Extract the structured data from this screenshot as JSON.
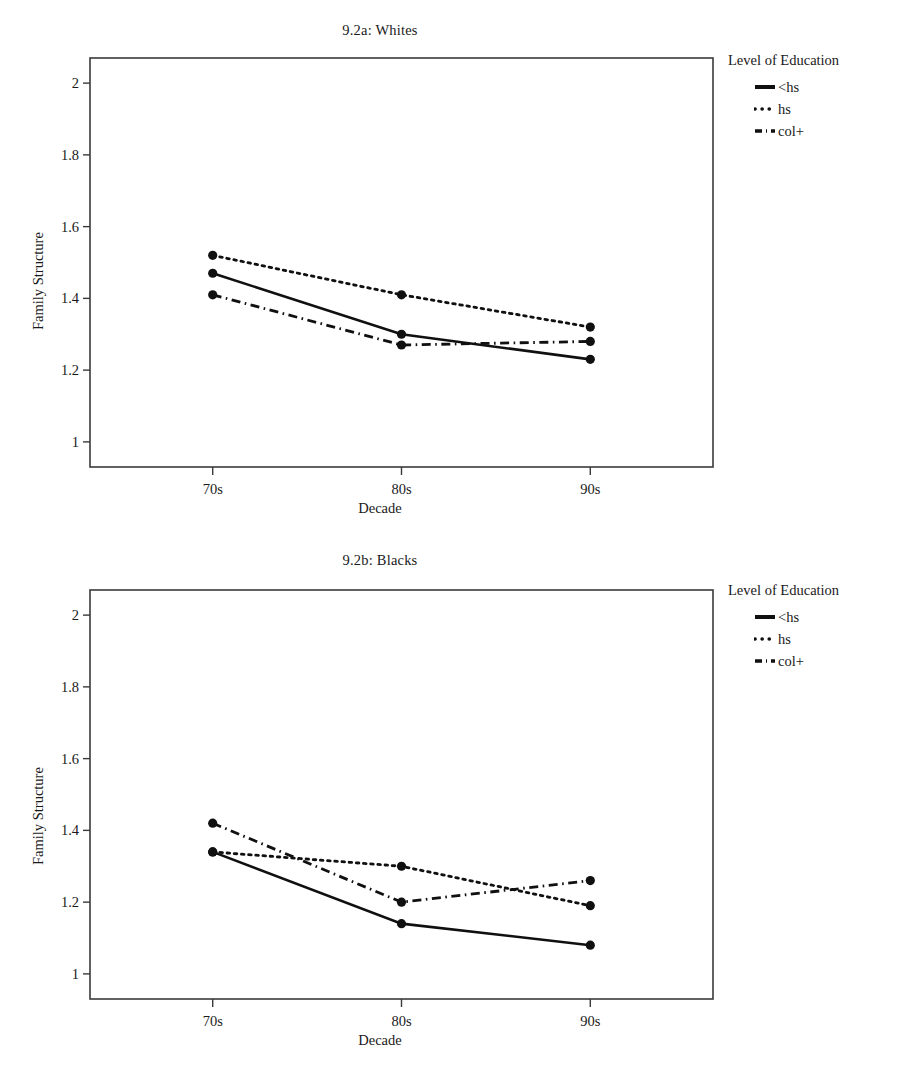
{
  "figures": [
    {
      "id": "a",
      "title": "9.2a: Whites",
      "xlabel": "Decade",
      "ylabel": "Family Structure",
      "legend_title": "Level of Education"
    },
    {
      "id": "b",
      "title": "9.2b: Blacks",
      "xlabel": "Decade",
      "ylabel": "Family Structure",
      "legend_title": "Level of Education"
    }
  ],
  "chart_data": [
    {
      "type": "line",
      "title": "9.2a: Whites",
      "xlabel": "Decade",
      "ylabel": "Family Structure",
      "categories": [
        "70s",
        "80s",
        "90s"
      ],
      "xticklabels": [
        "70s",
        "80s",
        "90s"
      ],
      "yticklabels": [
        "1",
        "1.2",
        "1.4",
        "1.6",
        "1.8",
        "2"
      ],
      "yticks": [
        1,
        1.2,
        1.4,
        1.6,
        1.8,
        2
      ],
      "ylim": [
        0.93,
        2.07
      ],
      "grid": false,
      "legend_title": "Level of Education",
      "legend_position": "right",
      "series": [
        {
          "name": "<hs",
          "style": "solid",
          "values": [
            1.47,
            1.3,
            1.23
          ]
        },
        {
          "name": "hs",
          "style": "dotted",
          "values": [
            1.52,
            1.41,
            1.32
          ]
        },
        {
          "name": "col+",
          "style": "dashdot",
          "values": [
            1.41,
            1.27,
            1.28
          ]
        }
      ]
    },
    {
      "type": "line",
      "title": "9.2b: Blacks",
      "xlabel": "Decade",
      "ylabel": "Family Structure",
      "categories": [
        "70s",
        "80s",
        "90s"
      ],
      "xticklabels": [
        "70s",
        "80s",
        "90s"
      ],
      "yticklabels": [
        "1",
        "1.2",
        "1.4",
        "1.6",
        "1.8",
        "2"
      ],
      "yticks": [
        1,
        1.2,
        1.4,
        1.6,
        1.8,
        2
      ],
      "ylim": [
        0.93,
        2.07
      ],
      "grid": false,
      "legend_title": "Level of Education",
      "legend_position": "right",
      "series": [
        {
          "name": "<hs",
          "style": "solid",
          "values": [
            1.34,
            1.14,
            1.08
          ]
        },
        {
          "name": "hs",
          "style": "dotted",
          "values": [
            1.34,
            1.3,
            1.19
          ]
        },
        {
          "name": "col+",
          "style": "dashdot",
          "values": [
            1.42,
            1.2,
            1.26
          ]
        }
      ]
    }
  ],
  "style": {
    "line_color": "#101010",
    "frame_color": "#3a3a3a",
    "marker_color": "#101010"
  }
}
